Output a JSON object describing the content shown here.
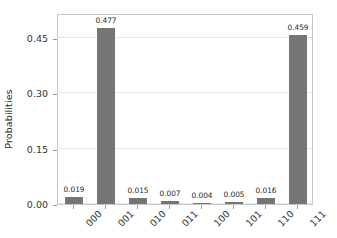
{
  "chart_data": {
    "type": "bar",
    "title": "",
    "xlabel": "",
    "ylabel": "Probabilities",
    "categories": [
      "000",
      "001",
      "010",
      "011",
      "100",
      "101",
      "110",
      "111"
    ],
    "values": [
      0.019,
      0.477,
      0.015,
      0.007,
      0.004,
      0.005,
      0.016,
      0.459
    ],
    "value_labels": [
      "0.019",
      "0.477",
      "0.015",
      "0.007",
      "0.004",
      "0.005",
      "0.016",
      "0.459"
    ],
    "ylim": [
      0.0,
      0.5175
    ],
    "yticks": [
      0.0,
      0.15,
      0.3,
      0.45
    ],
    "ytick_labels": [
      "0.00",
      "0.15",
      "0.30",
      "0.45"
    ],
    "grid": "horizontal",
    "legend": "none",
    "bar_color": "#757575",
    "grid_color": "#e9e9e9",
    "frame_color": "#c8c8c8",
    "xtick_rotation": -45
  }
}
